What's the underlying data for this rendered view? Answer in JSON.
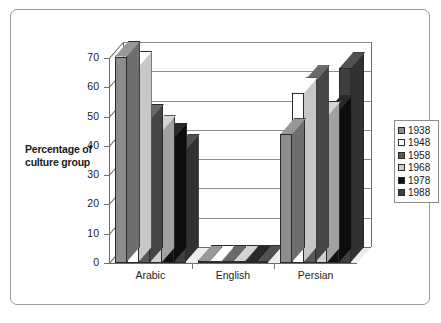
{
  "chart_data": {
    "type": "bar",
    "title": "",
    "subtitle": "",
    "xlabel": "",
    "ylabel": "Percentage of culture group",
    "categories": [
      "Arabic",
      "English",
      "Persian"
    ],
    "series": [
      {
        "name": "1938",
        "color": "#8d8d8d",
        "values": [
          70.5,
          0.6,
          44.0
        ]
      },
      {
        "name": "1948",
        "color": "#ffffff",
        "values": [
          67.0,
          0.6,
          58.0
        ]
      },
      {
        "name": "1958",
        "color": "#595959",
        "values": [
          49.0,
          0.6,
          62.0
        ]
      },
      {
        "name": "1968",
        "color": "#cfcfcf",
        "values": [
          45.0,
          0.6,
          50.0
        ]
      },
      {
        "name": "1978",
        "color": "#111111",
        "values": [
          42.5,
          0.6,
          52.0
        ]
      },
      {
        "name": "1988",
        "color": "#3f3f3f",
        "values": [
          38.5,
          0.6,
          66.5
        ]
      }
    ],
    "ylim": [
      0,
      70
    ],
    "yticks": [
      0,
      10,
      20,
      30,
      40,
      50,
      60,
      70
    ],
    "ytick_labels": [
      "0",
      "10",
      "20",
      "30",
      "40",
      "50",
      "60",
      "70"
    ],
    "grid": true,
    "grid_axis": "y",
    "legend_position": "right",
    "three_d": true
  },
  "legend": {
    "entries": [
      {
        "label": "1938"
      },
      {
        "label": "1948"
      },
      {
        "label": "1958"
      },
      {
        "label": "1968"
      },
      {
        "label": "1978"
      },
      {
        "label": "1988"
      }
    ]
  },
  "axes": {
    "y_title": "Percentage of culture group",
    "y_title_line1": "Percentage of",
    "y_title_line2": "culture group"
  }
}
